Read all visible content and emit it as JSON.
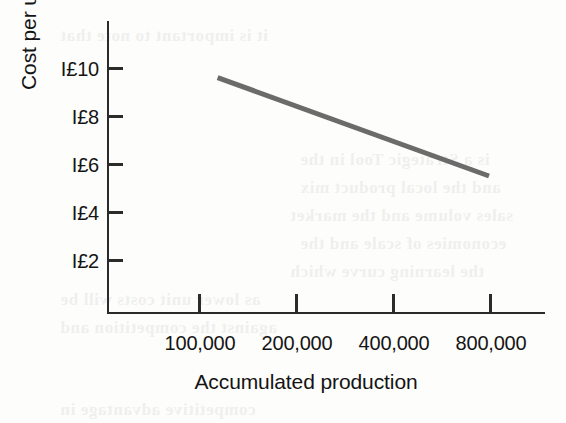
{
  "figure": {
    "kind": "experience-curve-figure",
    "line_color": "#6b6b6b",
    "axis_color": "#2b2b2b",
    "background": "#fdfdfc"
  },
  "axes": {
    "y_title": "Cost per unit",
    "x_title": "Accumulated production",
    "y_tick_labels": [
      "I£10",
      "I£8",
      "I£6",
      "I£4",
      "I£2"
    ],
    "x_tick_labels": [
      "100,000",
      "200,000",
      "400,000",
      "800,000"
    ]
  },
  "ghost_text": [
    "is a Strategic Tool in the",
    "and the local product mix",
    "sales volume and the market",
    "economies of scale and the",
    "the learning curve which",
    "as lower unit costs will be",
    "against the competition and",
    "it is important to note that",
    "competitive advantage in"
  ],
  "chart_data": {
    "type": "line",
    "title": "",
    "xlabel": "Accumulated production",
    "ylabel": "Cost per unit",
    "x_scale": "log2",
    "x_tick_values": [
      100000,
      200000,
      400000,
      800000
    ],
    "x_tick_labels": [
      "100,000",
      "200,000",
      "400,000",
      "800,000"
    ],
    "y_tick_values": [
      2,
      4,
      6,
      8,
      10
    ],
    "y_tick_labels": [
      "I£10",
      "I£8",
      "I£6",
      "I£4",
      "I£2"
    ],
    "ylim": [
      0,
      11
    ],
    "grid": false,
    "legend": null,
    "series": [
      {
        "name": "Cost per unit",
        "x": [
          115000,
          800000
        ],
        "y": [
          9.6,
          5.5
        ],
        "points": [
          {
            "x": 115000,
            "y": 9.6
          },
          {
            "x": 800000,
            "y": 5.5
          }
        ],
        "color": "#6b6b6b",
        "line_width_px": 5,
        "note": "straight declining line on a log-x axis; cost falls roughly 20% per doubling of accumulated production"
      }
    ]
  }
}
